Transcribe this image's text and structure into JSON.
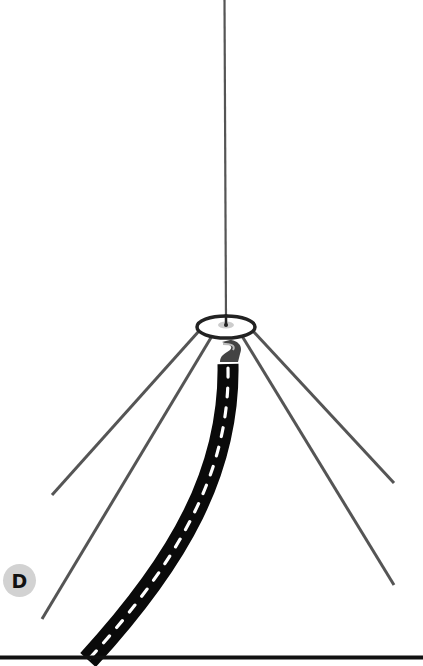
{
  "diagram": {
    "label_badge": "D",
    "colors": {
      "line": "#555555",
      "cable": "#0a0a0a",
      "cable_dash": "#ffffff",
      "ground": "#111111",
      "badge_bg": "#d2d2d2",
      "ring": "#222222"
    },
    "elements": {
      "mast": "vertical antenna element",
      "ring": "mounting ring / hub",
      "radials": [
        "upper-left radial",
        "lower-left radial",
        "upper-right radial",
        "lower-right radial"
      ],
      "cable": "coaxial feed line",
      "ground": "ground line"
    }
  }
}
